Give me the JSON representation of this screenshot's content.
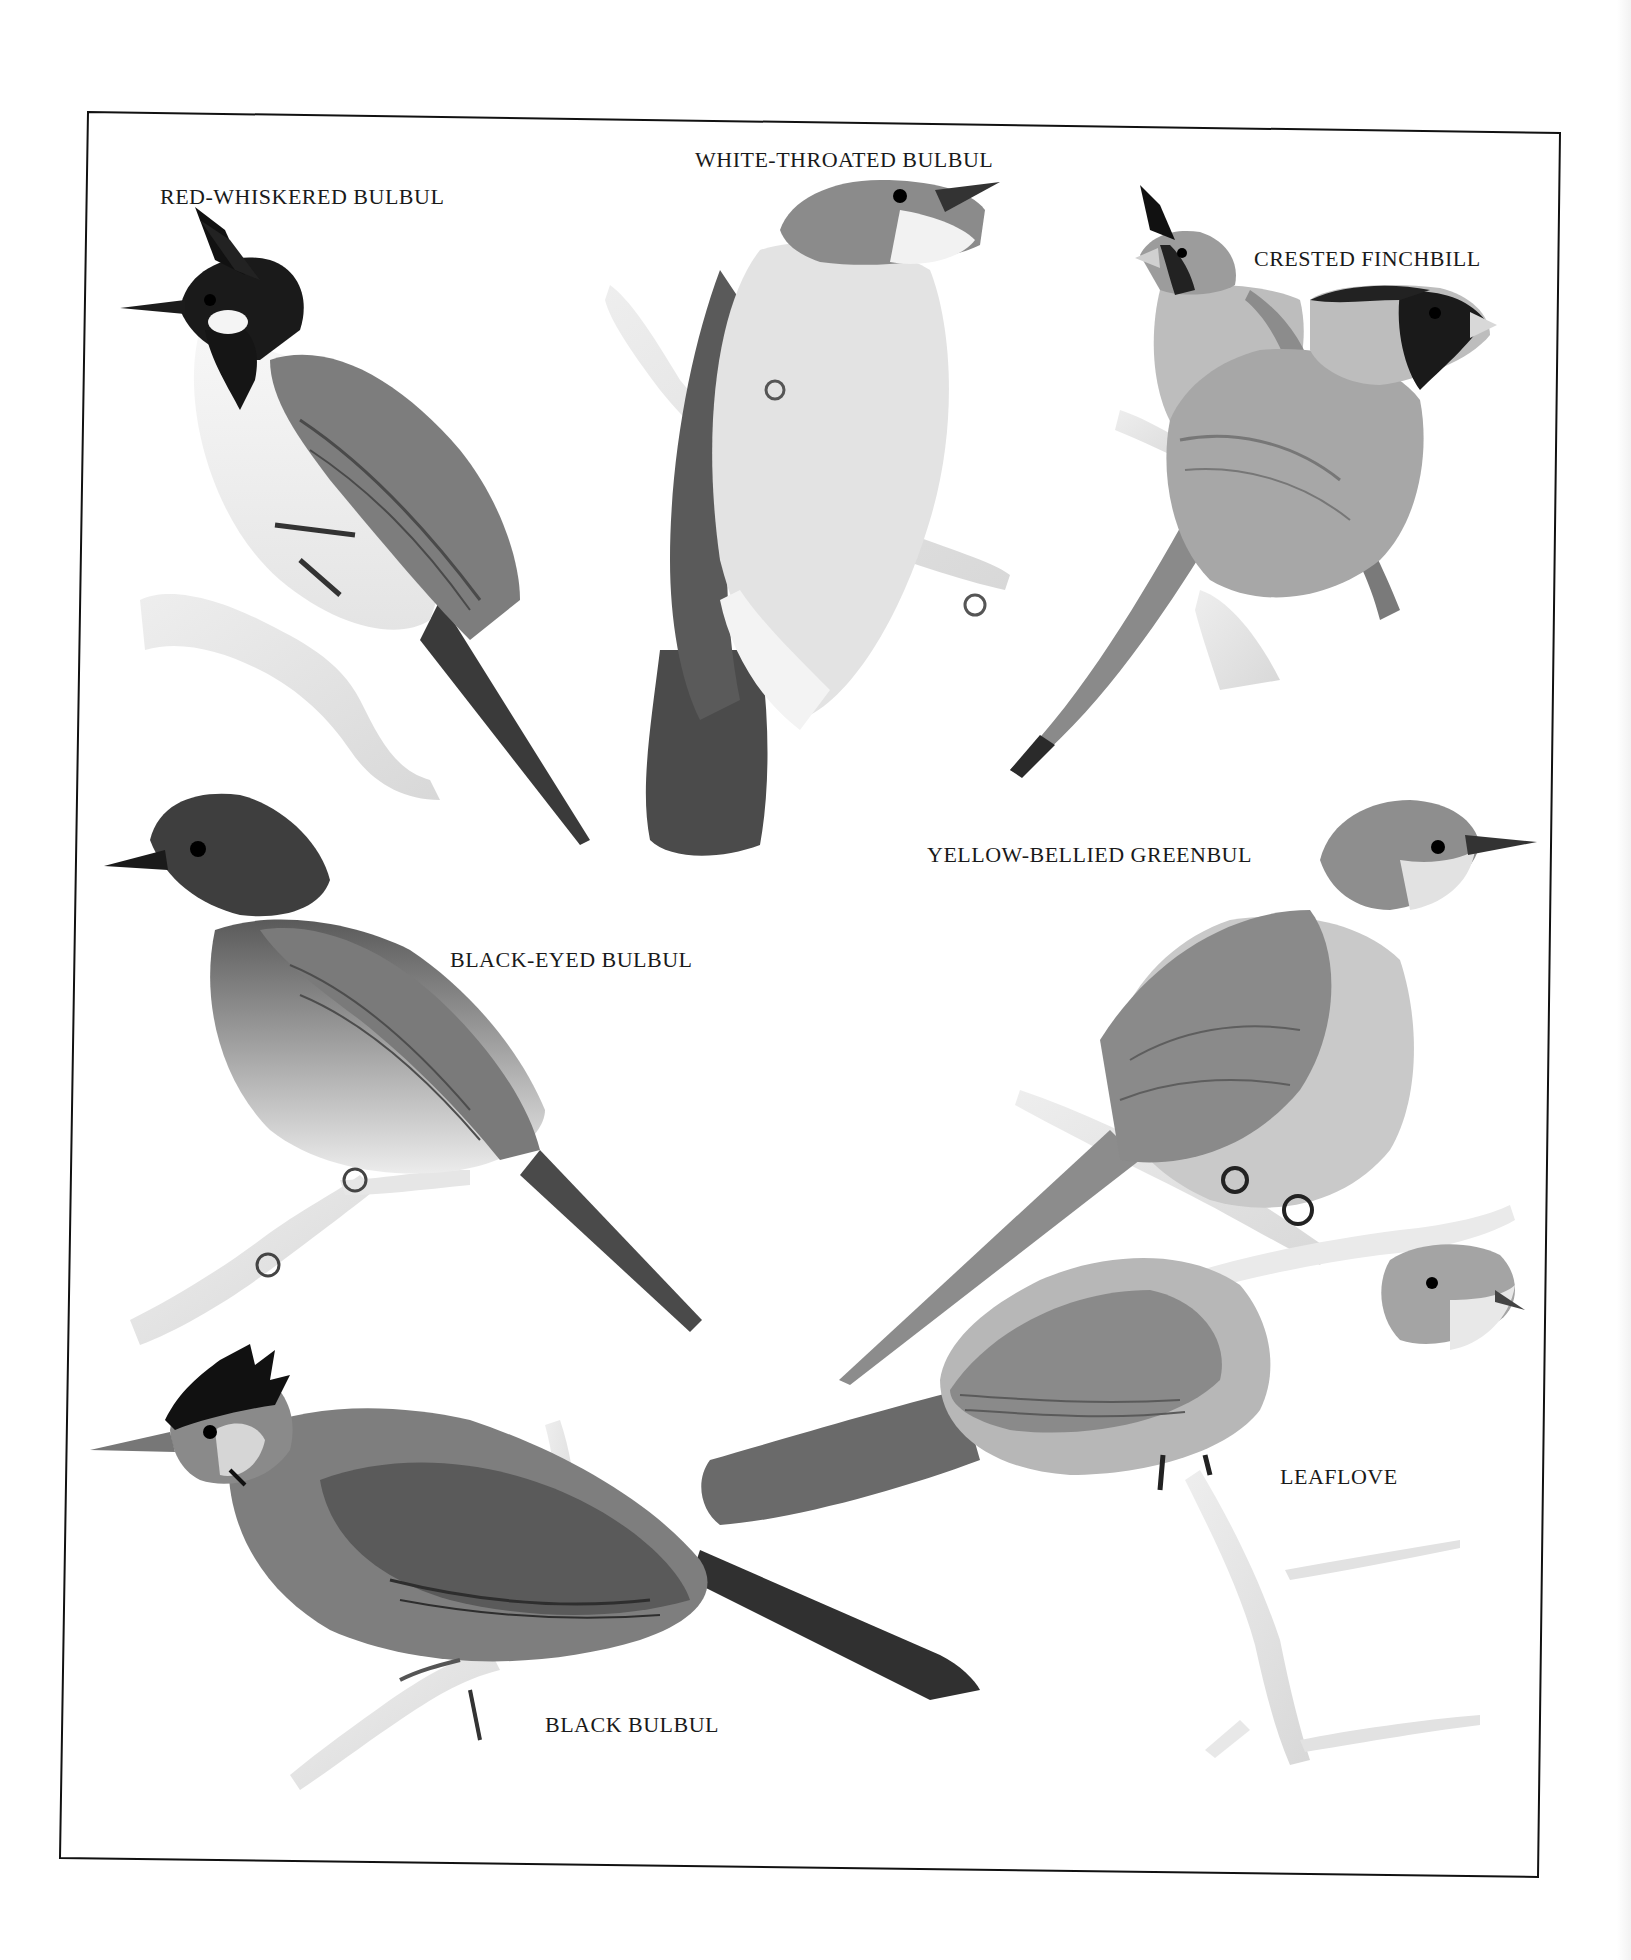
{
  "plate": {
    "frame_color": "#111111",
    "labels": [
      {
        "id": "red-whiskered-bulbul",
        "text": "RED-WHISKERED BULBUL",
        "x": 160,
        "y": 186
      },
      {
        "id": "white-throated-bulbul",
        "text": "WHITE-THROATED BULBUL",
        "x": 695,
        "y": 149
      },
      {
        "id": "crested-finchbill",
        "text": "CRESTED FINCHBILL",
        "x": 1254,
        "y": 248
      },
      {
        "id": "yellow-bellied-greenbul",
        "text": "YELLOW-BELLIED GREENBUL",
        "x": 927,
        "y": 844
      },
      {
        "id": "black-eyed-bulbul",
        "text": "BLACK-EYED BULBUL",
        "x": 450,
        "y": 949
      },
      {
        "id": "leaflove",
        "text": "LEAFLOVE",
        "x": 1280,
        "y": 1466
      },
      {
        "id": "black-bulbul",
        "text": "BLACK BULBUL",
        "x": 545,
        "y": 1714
      }
    ]
  }
}
